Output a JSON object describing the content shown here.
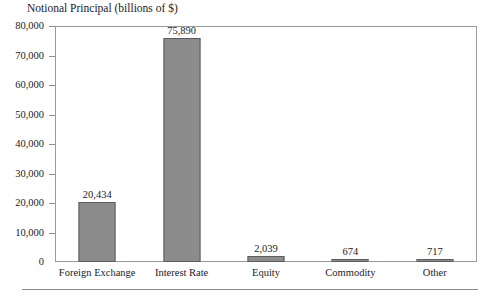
{
  "chart_data": {
    "type": "bar",
    "title": "Notional Principal (billions of $)",
    "xlabel": "",
    "ylabel": "",
    "categories": [
      "Foreign Exchange",
      "Interest Rate",
      "Equity",
      "Commodity",
      "Other"
    ],
    "values": [
      20434,
      75890,
      2039,
      674,
      717
    ],
    "value_labels": [
      "20,434",
      "75,890",
      "2,039",
      "674",
      "717"
    ],
    "ylim": [
      0,
      80000
    ],
    "ytick_values": [
      0,
      10000,
      20000,
      30000,
      40000,
      50000,
      60000,
      70000,
      80000
    ],
    "ytick_labels": [
      "0",
      "10,000",
      "20,000",
      "30,000",
      "40,000",
      "50,000",
      "60,000",
      "70,000",
      "80,000"
    ],
    "grid": false,
    "legend": false,
    "bar_color": "#8c8c8c",
    "bar_border_color": "#5c5c5c",
    "frame_color": "#9a9a9a"
  }
}
